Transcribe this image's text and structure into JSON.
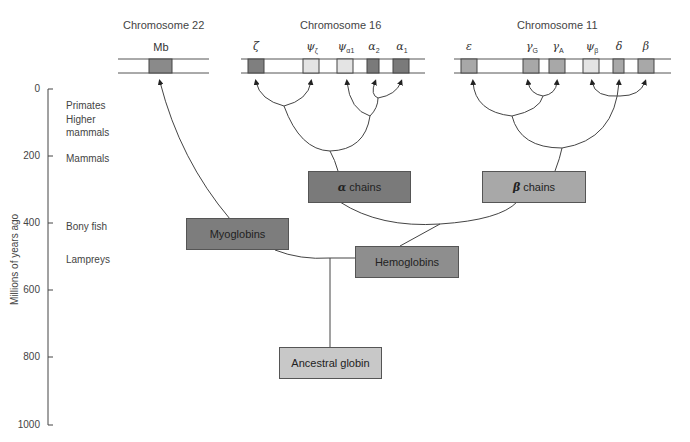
{
  "chromosomes": [
    {
      "title": "Chromosome 22",
      "genes": [
        {
          "symbol": "Mb",
          "sub": "",
          "fill": "#8a8a8a"
        }
      ]
    },
    {
      "title": "Chromosome 16",
      "genes": [
        {
          "symbol": "ζ",
          "sub": "",
          "fill": "#7f7f7f"
        },
        {
          "symbol": "ψ",
          "sub": "ζ",
          "fill": "#e4e4e4"
        },
        {
          "symbol": "ψ",
          "sub": "α1",
          "fill": "#e4e4e4"
        },
        {
          "symbol": "α",
          "sub": "2",
          "fill": "#7a7a7a"
        },
        {
          "symbol": "α",
          "sub": "1",
          "fill": "#7a7a7a"
        }
      ]
    },
    {
      "title": "Chromosome 11",
      "genes": [
        {
          "symbol": "ε",
          "sub": "",
          "fill": "#a8a8a8"
        },
        {
          "symbol": "γ",
          "sub": "G",
          "fill": "#a8a8a8"
        },
        {
          "symbol": "γ",
          "sub": "A",
          "fill": "#a8a8a8"
        },
        {
          "symbol": "ψ",
          "sub": "β",
          "fill": "#e4e4e4"
        },
        {
          "symbol": "δ",
          "sub": "",
          "fill": "#a8a8a8"
        },
        {
          "symbol": "β",
          "sub": "",
          "fill": "#a8a8a8"
        }
      ]
    }
  ],
  "axis": {
    "label": "Millions of years ago",
    "ticks": [
      "0",
      "200",
      "400",
      "600",
      "800",
      "1000"
    ]
  },
  "eras": [
    {
      "label": "Primates",
      "mya": 50
    },
    {
      "label": "Higher",
      "mya": 100
    },
    {
      "label": "mammals",
      "mya": 130
    },
    {
      "label": "Mammals",
      "mya": 210
    },
    {
      "label": "Bony fish",
      "mya": 410
    },
    {
      "label": "Lampreys",
      "mya": 510
    }
  ],
  "nodes": {
    "myoglobins": {
      "label": "Myoglobins",
      "fill": "#7d7d7d"
    },
    "hemoglobins": {
      "label": "Hemoglobins",
      "fill": "#8e8e8e"
    },
    "alpha_chains": {
      "symbol": "α",
      "label": "chains",
      "fill": "#7a7a7a"
    },
    "beta_chains": {
      "symbol": "β",
      "label": "chains",
      "fill": "#a8a8a8"
    },
    "ancestral": {
      "label": "Ancestral globin",
      "fill": "#c8c8c8"
    }
  }
}
